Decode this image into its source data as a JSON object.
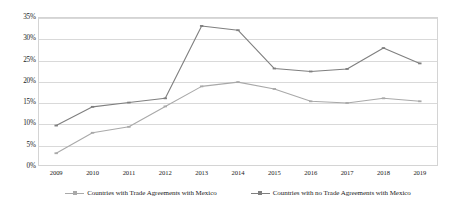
{
  "chart_data": {
    "type": "line",
    "title": "",
    "subtitle": "",
    "xlabel": "",
    "ylabel": "",
    "x": [
      "2009",
      "2010",
      "2011",
      "2012",
      "2013",
      "2014",
      "2015",
      "2016",
      "2017",
      "2018",
      "2019"
    ],
    "categories": [
      "2009",
      "2010",
      "2011",
      "2012",
      "2013",
      "2014",
      "2015",
      "2016",
      "2017",
      "2018",
      "2019"
    ],
    "ylim": [
      0,
      35
    ],
    "ytick_labels": [
      "0%",
      "5%",
      "10%",
      "15%",
      "20%",
      "25%",
      "30%",
      "35%"
    ],
    "ytick_values": [
      0,
      5,
      10,
      15,
      20,
      25,
      30,
      35
    ],
    "grid": true,
    "legend_position": "bottom",
    "series": [
      {
        "name": "Countries with Trade Agreements with Mexico",
        "color": "#a9a9a9",
        "marker": "dash",
        "values": [
          3.0,
          7.8,
          9.2,
          14.0,
          18.7,
          19.7,
          18.1,
          15.2,
          14.8,
          15.9,
          15.2
        ]
      },
      {
        "name": "Countries with no Trade Agreements with Mexico",
        "color": "#7f7f7f",
        "marker": "dash",
        "values": [
          9.5,
          13.9,
          14.9,
          15.9,
          32.9,
          31.9,
          22.9,
          22.2,
          22.8,
          27.7,
          24.1
        ]
      }
    ]
  },
  "legend": {
    "entries": [
      {
        "label": "Countries with Trade Agreements with Mexico"
      },
      {
        "label": "Countries with no Trade Agreements with Mexico"
      }
    ]
  },
  "colors": {
    "series_low": "#a9a9a9",
    "series_high": "#7f7f7f",
    "grid": "#d9d9d9",
    "border": "#d4d4d4",
    "text": "#222222",
    "background": "#ffffff"
  }
}
